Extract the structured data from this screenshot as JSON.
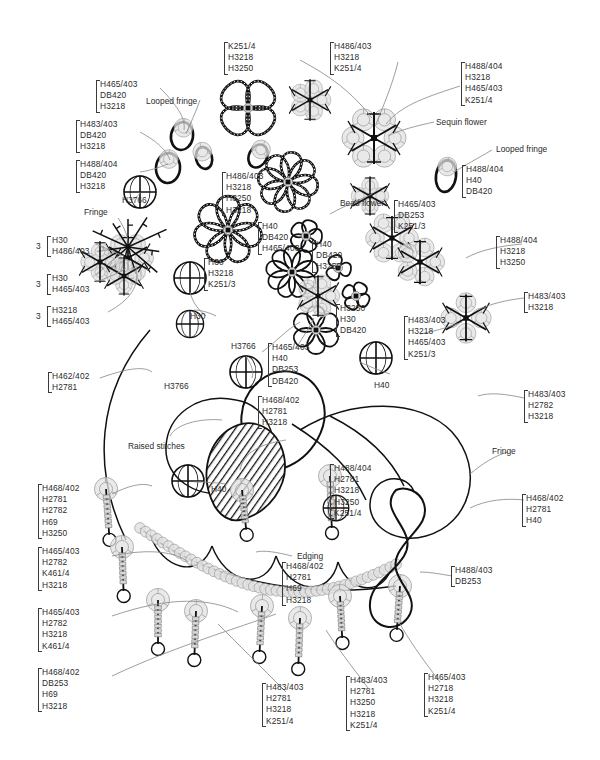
{
  "diagram": {
    "bead_size": 600,
    "technique_labels": [
      {
        "id": "looped-fringe-1",
        "text": "Looped fringe",
        "x": 146,
        "y": 96
      },
      {
        "id": "fringe-1",
        "text": "Fringe",
        "x": 84,
        "y": 207
      },
      {
        "id": "sequin-flower",
        "text": "Sequin flower",
        "x": 436,
        "y": 117
      },
      {
        "id": "looped-fringe-2",
        "text": "Looped fringe",
        "x": 496,
        "y": 144
      },
      {
        "id": "bead-flower",
        "text": "Bead flower",
        "x": 340,
        "y": 198
      },
      {
        "id": "raised-stitches",
        "text": "Raised stitches",
        "x": 128,
        "y": 441
      },
      {
        "id": "edging",
        "text": "Edging",
        "x": 297,
        "y": 551
      },
      {
        "id": "fringe-2",
        "text": "Fringe",
        "x": 492,
        "y": 446
      }
    ],
    "single_labels": [
      {
        "id": "h3766-a",
        "text": "H3766",
        "x": 122,
        "y": 195
      },
      {
        "id": "h30-a",
        "text": "H30",
        "x": 190,
        "y": 311
      },
      {
        "id": "h3766-b",
        "text": "H3766",
        "x": 231,
        "y": 341
      },
      {
        "id": "h3766-c",
        "text": "H3766",
        "x": 164,
        "y": 381
      },
      {
        "id": "h40-a",
        "text": "H40",
        "x": 374,
        "y": 380
      },
      {
        "id": "h40-b",
        "text": "H40",
        "x": 211,
        "y": 484
      }
    ],
    "code_groups": [
      {
        "id": "g-k251-top",
        "x": 228,
        "y": 42,
        "lines": [
          "K251/4",
          "H3218",
          "H3250"
        ]
      },
      {
        "id": "g-h486-top",
        "x": 334,
        "y": 42,
        "lines": [
          "H486/403",
          "H3218",
          "K251/4"
        ]
      },
      {
        "id": "g-h488-top-right",
        "x": 465,
        "y": 62,
        "lines": [
          "H488/404",
          "H3218",
          "H465/403",
          "K251/4"
        ]
      },
      {
        "id": "g-h465-upper-left",
        "x": 100,
        "y": 80,
        "lines": [
          "H465/403",
          "DB420",
          "H3218"
        ]
      },
      {
        "id": "g-h483-left",
        "x": 80,
        "y": 120,
        "lines": [
          "H483/403",
          "DB420",
          "H3218"
        ]
      },
      {
        "id": "g-h488-left",
        "x": 80,
        "y": 160,
        "lines": [
          "H488/404",
          "DB420",
          "H3218"
        ]
      },
      {
        "id": "g-h488-h40-db420",
        "x": 466,
        "y": 165,
        "lines": [
          "H488/404",
          "H40",
          "DB420"
        ]
      },
      {
        "id": "g-h486-center",
        "x": 226,
        "y": 172,
        "lines": [
          "H486/403",
          "H3218",
          "H3250",
          "H3218"
        ]
      },
      {
        "id": "g-h40-db420-h465",
        "x": 262,
        "y": 222,
        "lines": [
          "H40",
          "DB420",
          "H465/403"
        ]
      },
      {
        "id": "g-h40-db420-h3250",
        "x": 316,
        "y": 240,
        "lines": [
          "H40",
          "DB420",
          "H3250"
        ]
      },
      {
        "id": "g-h465-db253-k251",
        "x": 398,
        "y": 200,
        "lines": [
          "H465/403",
          "DB253",
          "K251/3"
        ]
      },
      {
        "id": "g-h488-h3218-h3250",
        "x": 500,
        "y": 236,
        "lines": [
          "H488/404",
          "H3218",
          "H3250"
        ]
      },
      {
        "id": "g-h30-h3218-k251",
        "x": 208,
        "y": 258,
        "lines": [
          "H30",
          "H3218",
          "K251/3"
        ]
      },
      {
        "id": "g-h3250-h30-db420",
        "x": 340,
        "y": 304,
        "lines": [
          "H3250",
          "H30",
          "DB420"
        ]
      },
      {
        "id": "g-h483-h3218-h465-k251",
        "x": 408,
        "y": 316,
        "lines": [
          "H483/403",
          "H3218",
          "H465/403",
          "K251/3"
        ]
      },
      {
        "id": "g-h483-h3218-right",
        "x": 528,
        "y": 292,
        "lines": [
          "H483/403",
          "H3218"
        ]
      },
      {
        "id": "g-h465-h40-db253-db420",
        "x": 272,
        "y": 343,
        "lines": [
          "H465/403",
          "H40",
          "DB253",
          "DB420"
        ]
      },
      {
        "id": "g-h462-h2781",
        "x": 52,
        "y": 372,
        "lines": [
          "H462/402",
          "H2781"
        ]
      },
      {
        "id": "g-h468-h2781-h3218",
        "x": 262,
        "y": 396,
        "lines": [
          "H468/402",
          "H2781",
          "H3218"
        ]
      },
      {
        "id": "g-h483-h2782-h3218",
        "x": 528,
        "y": 390,
        "lines": [
          "H483/403",
          "H2782",
          "H3218"
        ]
      },
      {
        "id": "g-h488-h2781-h3218-h3250-k251",
        "x": 334,
        "y": 464,
        "lines": [
          "H488/404",
          "H2781",
          "H3218",
          "H3250",
          "K251/4"
        ]
      },
      {
        "id": "g-h468-h2781-h40",
        "x": 526,
        "y": 494,
        "lines": [
          "H468/402",
          "H2781",
          "H40"
        ]
      },
      {
        "id": "g-h468-left-5",
        "x": 42,
        "y": 484,
        "lines": [
          "H468/402",
          "H2781",
          "H2782",
          "H69",
          "H3250"
        ]
      },
      {
        "id": "g-h465-h2782-k461-h3218",
        "x": 42,
        "y": 547,
        "lines": [
          "H465/403",
          "H2782",
          "K461/4",
          "H3218"
        ]
      },
      {
        "id": "g-h465-h2782-h3218-k461",
        "x": 42,
        "y": 608,
        "lines": [
          "H465/403",
          "H2782",
          "H3218",
          "K461/4"
        ]
      },
      {
        "id": "g-h468-db253-h69-h3218",
        "x": 42,
        "y": 668,
        "lines": [
          "H468/402",
          "DB253",
          "H69",
          "H3218"
        ]
      },
      {
        "id": "g-h468-h2781-h69-h3218",
        "x": 286,
        "y": 562,
        "lines": [
          "H468/402",
          "H2781",
          "H69",
          "H3218"
        ]
      },
      {
        "id": "g-h488-db253",
        "x": 455,
        "y": 566,
        "lines": [
          "H488/403",
          "DB253"
        ]
      },
      {
        "id": "g-h483-h2781-h3218-k251",
        "x": 266,
        "y": 683,
        "lines": [
          "H483/403",
          "H2781",
          "H3218",
          "K251/4"
        ]
      },
      {
        "id": "g-h483-h2781-h3250-h3218-k251",
        "x": 350,
        "y": 676,
        "lines": [
          "H483/403",
          "H2781",
          "H3250",
          "H3218",
          "K251/4"
        ]
      },
      {
        "id": "g-h465-h2718-h3218-k251",
        "x": 428,
        "y": 673,
        "lines": [
          "H465/403",
          "H2718",
          "H3218",
          "K251/4"
        ]
      }
    ],
    "multiplied_groups": [
      {
        "id": "m-h30-h486",
        "x": 36,
        "y": 236,
        "mult": "3",
        "lines": [
          "H30",
          "H486/403"
        ]
      },
      {
        "id": "m-h30-h465",
        "x": 36,
        "y": 274,
        "mult": "3",
        "lines": [
          "H30",
          "H465/403"
        ]
      },
      {
        "id": "m-h3218-h465",
        "x": 36,
        "y": 306,
        "mult": "3",
        "lines": [
          "H3218",
          "H465/403"
        ]
      }
    ],
    "colors": {
      "ink": "#1a1a1a",
      "label": "#2b2b2b",
      "leader": "#7a7a7a",
      "bead_fill": "#d9d9d9",
      "bead_stroke": "#8a8a8a"
    }
  }
}
